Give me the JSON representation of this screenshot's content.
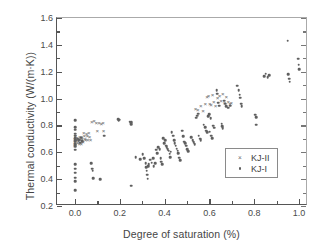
{
  "chart_data": {
    "type": "scatter",
    "title": "",
    "xlabel": "Degree of saturation (%)",
    "ylabel": "Thermal conductivity (W/(m·K))",
    "xlim": [
      -0.08,
      1.04
    ],
    "ylim": [
      0.2,
      1.6
    ],
    "xticks": [
      "0.0",
      "0.2",
      "0.4",
      "0.6",
      "0.8",
      "1.0"
    ],
    "xtick_values": [
      0.0,
      0.2,
      0.4,
      0.6,
      0.8,
      1.0
    ],
    "yticks": [
      "0.2",
      "0.4",
      "0.6",
      "0.8",
      "1.0",
      "1.2",
      "1.4",
      "1.6"
    ],
    "ytick_values": [
      0.2,
      0.4,
      0.6,
      0.8,
      1.0,
      1.2,
      1.4,
      1.6
    ],
    "grid": false,
    "minor_ticks": true,
    "legend_position": "lower right",
    "series": [
      {
        "name": "KJ-II",
        "marker": "x",
        "color": "#6a6a6a",
        "points": [
          [
            0.0,
            0.7
          ],
          [
            0.0,
            0.68
          ],
          [
            0.0,
            0.665
          ],
          [
            0.0,
            0.648
          ],
          [
            0.002,
            0.72
          ],
          [
            0.005,
            0.695
          ],
          [
            0.008,
            0.69
          ],
          [
            0.01,
            0.705
          ],
          [
            0.012,
            0.672
          ],
          [
            0.015,
            0.685
          ],
          [
            0.018,
            0.7
          ],
          [
            0.02,
            0.665
          ],
          [
            0.022,
            0.715
          ],
          [
            0.025,
            0.69
          ],
          [
            0.028,
            0.66
          ],
          [
            0.03,
            0.712
          ],
          [
            0.033,
            0.7
          ],
          [
            0.036,
            0.678
          ],
          [
            0.04,
            0.74
          ],
          [
            0.042,
            0.722
          ],
          [
            0.045,
            0.7
          ],
          [
            0.048,
            0.69
          ],
          [
            0.052,
            0.735
          ],
          [
            0.055,
            0.72
          ],
          [
            0.058,
            0.695
          ],
          [
            0.062,
            0.745
          ],
          [
            0.065,
            0.712
          ],
          [
            0.07,
            0.69
          ],
          [
            0.075,
            0.828
          ],
          [
            0.085,
            0.832
          ],
          [
            0.095,
            0.82
          ],
          [
            0.1,
            0.755
          ],
          [
            0.108,
            0.82
          ],
          [
            0.118,
            0.812
          ],
          [
            0.125,
            0.818
          ],
          [
            0.128,
            0.762
          ],
          [
            0.538,
            0.925
          ],
          [
            0.548,
            0.912
          ],
          [
            0.562,
            0.948
          ],
          [
            0.572,
            0.905
          ],
          [
            0.582,
            0.958
          ],
          [
            0.59,
            1.012
          ],
          [
            0.596,
            1.018
          ],
          [
            0.602,
            0.962
          ],
          [
            0.608,
            0.955
          ],
          [
            0.614,
            1.028
          ],
          [
            0.62,
            0.972
          ],
          [
            0.628,
            0.945
          ],
          [
            0.636,
            1.005
          ],
          [
            0.645,
            1.022
          ],
          [
            0.652,
            0.985
          ],
          [
            0.66,
            1.032
          ],
          [
            0.668,
            0.968
          ],
          [
            0.676,
            1.008
          ],
          [
            0.684,
            0.975
          ],
          [
            0.692,
            0.958
          ],
          [
            0.698,
            0.965
          ]
        ]
      },
      {
        "name": "KJ-I",
        "marker": "dot",
        "color": "#5f5f5f",
        "points": [
          [
            0.0,
            0.838
          ],
          [
            0.0,
            0.788
          ],
          [
            0.0,
            0.768
          ],
          [
            0.0,
            0.738
          ],
          [
            0.0,
            0.722
          ],
          [
            0.0,
            0.705
          ],
          [
            0.0,
            0.692
          ],
          [
            0.0,
            0.678
          ],
          [
            0.0,
            0.662
          ],
          [
            0.0,
            0.645
          ],
          [
            0.0,
            0.62
          ],
          [
            0.0,
            0.512
          ],
          [
            0.0,
            0.478
          ],
          [
            0.0,
            0.448
          ],
          [
            0.0,
            0.412
          ],
          [
            0.0,
            0.385
          ],
          [
            0.0,
            0.318
          ],
          [
            0.012,
            0.702
          ],
          [
            0.016,
            0.688
          ],
          [
            0.02,
            0.695
          ],
          [
            0.024,
            0.672
          ],
          [
            0.028,
            0.708
          ],
          [
            0.032,
            0.682
          ],
          [
            0.072,
            0.52
          ],
          [
            0.078,
            0.478
          ],
          [
            0.08,
            0.462
          ],
          [
            0.082,
            0.408
          ],
          [
            0.112,
            0.398
          ],
          [
            0.13,
            0.725
          ],
          [
            0.192,
            0.848
          ],
          [
            0.196,
            0.838
          ],
          [
            0.2,
            0.842
          ],
          [
            0.245,
            0.828
          ],
          [
            0.248,
            0.818
          ],
          [
            0.25,
            0.81
          ],
          [
            0.252,
            0.822
          ],
          [
            0.25,
            0.352
          ],
          [
            0.272,
            0.565
          ],
          [
            0.292,
            0.548
          ],
          [
            0.302,
            0.585
          ],
          [
            0.308,
            0.555
          ],
          [
            0.315,
            0.52
          ],
          [
            0.318,
            0.488
          ],
          [
            0.32,
            0.462
          ],
          [
            0.322,
            0.432
          ],
          [
            0.324,
            0.402
          ],
          [
            0.326,
            0.498
          ],
          [
            0.33,
            0.512
          ],
          [
            0.335,
            0.545
          ],
          [
            0.342,
            0.522
          ],
          [
            0.348,
            0.558
          ],
          [
            0.352,
            0.498
          ],
          [
            0.358,
            0.518
          ],
          [
            0.362,
            0.618
          ],
          [
            0.366,
            0.592
          ],
          [
            0.372,
            0.64
          ],
          [
            0.378,
            0.625
          ],
          [
            0.382,
            0.555
          ],
          [
            0.386,
            0.53
          ],
          [
            0.39,
            0.512
          ],
          [
            0.395,
            0.705
          ],
          [
            0.398,
            0.668
          ],
          [
            0.402,
            0.69
          ],
          [
            0.406,
            0.648
          ],
          [
            0.41,
            0.64
          ],
          [
            0.414,
            0.622
          ],
          [
            0.418,
            0.612
          ],
          [
            0.422,
            0.588
          ],
          [
            0.425,
            0.565
          ],
          [
            0.428,
            0.605
          ],
          [
            0.432,
            0.748
          ],
          [
            0.438,
            0.722
          ],
          [
            0.442,
            0.69
          ],
          [
            0.446,
            0.668
          ],
          [
            0.45,
            0.648
          ],
          [
            0.455,
            0.628
          ],
          [
            0.458,
            0.612
          ],
          [
            0.462,
            0.595
          ],
          [
            0.466,
            0.56
          ],
          [
            0.47,
            0.542
          ],
          [
            0.478,
            0.762
          ],
          [
            0.482,
            0.72
          ],
          [
            0.488,
            0.68
          ],
          [
            0.492,
            0.668
          ],
          [
            0.496,
            0.648
          ],
          [
            0.5,
            0.625
          ],
          [
            0.505,
            0.608
          ],
          [
            0.52,
            0.712
          ],
          [
            0.525,
            0.688
          ],
          [
            0.53,
            0.675
          ],
          [
            0.535,
            0.66
          ],
          [
            0.54,
            0.858
          ],
          [
            0.545,
            0.872
          ],
          [
            0.55,
            0.888
          ],
          [
            0.552,
            0.725
          ],
          [
            0.558,
            0.702
          ],
          [
            0.562,
            0.688
          ],
          [
            0.575,
            0.805
          ],
          [
            0.58,
            0.785
          ],
          [
            0.585,
            0.762
          ],
          [
            0.59,
            0.748
          ],
          [
            0.595,
            0.868
          ],
          [
            0.6,
            0.885
          ],
          [
            0.605,
            0.855
          ],
          [
            0.602,
            0.752
          ],
          [
            0.608,
            0.722
          ],
          [
            0.612,
            0.705
          ],
          [
            0.618,
            0.798
          ],
          [
            0.622,
            0.782
          ],
          [
            0.632,
            1.062
          ],
          [
            0.636,
            1.035
          ],
          [
            0.64,
            0.968
          ],
          [
            0.645,
            0.948
          ],
          [
            0.655,
            0.812
          ],
          [
            0.658,
            0.795
          ],
          [
            0.66,
            0.778
          ],
          [
            0.665,
            0.985
          ],
          [
            0.67,
            0.962
          ],
          [
            0.675,
            0.945
          ],
          [
            0.685,
            0.932
          ],
          [
            0.692,
            0.948
          ],
          [
            0.725,
            1.095
          ],
          [
            0.73,
            1.062
          ],
          [
            0.735,
            1.028
          ],
          [
            0.738,
            1.005
          ],
          [
            0.742,
            0.962
          ],
          [
            0.745,
            0.945
          ],
          [
            0.805,
            0.88
          ],
          [
            0.808,
            0.862
          ],
          [
            0.81,
            0.805
          ],
          [
            0.845,
            1.168
          ],
          [
            0.852,
            1.185
          ],
          [
            0.86,
            1.158
          ],
          [
            0.868,
            1.172
          ],
          [
            0.95,
            1.432
          ],
          [
            0.952,
            1.182
          ],
          [
            0.955,
            1.148
          ],
          [
            0.958,
            1.125
          ],
          [
            0.995,
            1.298
          ],
          [
            0.998,
            1.252
          ],
          [
            1.0,
            1.218
          ]
        ]
      }
    ],
    "legend": [
      {
        "label": "KJ-II",
        "marker": "x"
      },
      {
        "label": "KJ-I",
        "marker": "dot"
      }
    ]
  }
}
